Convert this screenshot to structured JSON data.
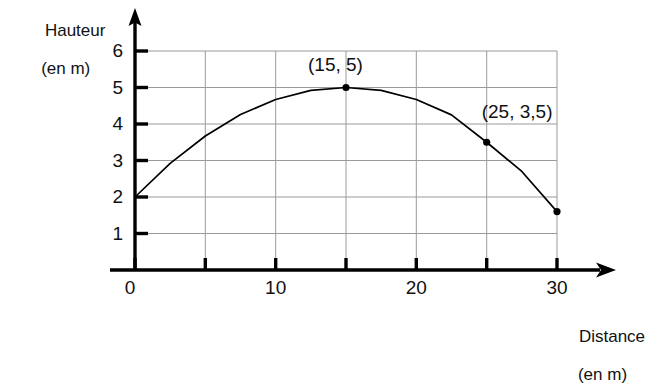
{
  "chart_data": {
    "type": "line",
    "title": "",
    "subtitle": "",
    "xlabel": "Distance",
    "xlabel_unit": "(en m)",
    "ylabel": "Hauteur",
    "ylabel_unit": "(en m)",
    "xlim": [
      0,
      32
    ],
    "ylim": [
      0,
      6.4
    ],
    "grid": true,
    "legend": null,
    "x_ticks": [
      0,
      5,
      10,
      15,
      20,
      25,
      30
    ],
    "x_tick_labels": [
      "0",
      "",
      "10",
      "",
      "20",
      "",
      "30"
    ],
    "y_ticks": [
      1,
      2,
      3,
      4,
      5,
      6
    ],
    "y_tick_labels": [
      "1",
      "2",
      "3",
      "4",
      "5",
      "6"
    ],
    "series": [
      {
        "name": "trajectoire",
        "type": "parabola",
        "color": "#000000",
        "x": [
          0,
          2.5,
          5,
          7.5,
          10,
          12.5,
          15,
          17.5,
          20,
          22.5,
          25,
          27.5,
          30
        ],
        "y": [
          2.0,
          2.92,
          3.67,
          4.26,
          4.67,
          4.92,
          5.0,
          4.92,
          4.67,
          4.25,
          3.5,
          2.7,
          1.6
        ]
      }
    ],
    "markers": [
      {
        "x": 15,
        "y": 5,
        "label": "(15, 5)"
      },
      {
        "x": 25,
        "y": 3.5,
        "label": "(25, 3,5)"
      },
      {
        "x": 30,
        "y": 1.6,
        "label": ""
      }
    ],
    "annotations": [
      {
        "text": "(15, 5)",
        "x": 15,
        "y": 5.6
      },
      {
        "text": "(25, 3,5)",
        "x": 26,
        "y": 4.3
      }
    ],
    "colors": {
      "curve": "#000000",
      "grid": "#9a9a9a",
      "axis": "#000000",
      "text": "#111111",
      "background": "#ffffff"
    }
  }
}
